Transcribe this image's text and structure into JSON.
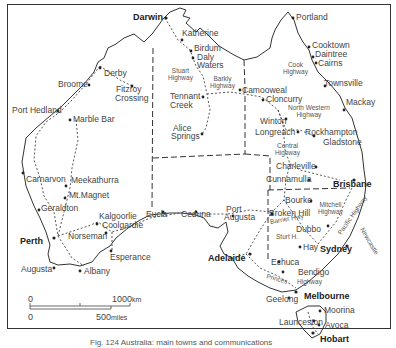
{
  "map": {
    "title": "Map of Australia — main towns and highways",
    "cities_bold": [
      {
        "name": "Darwin",
        "x": 133,
        "y": 13
      },
      {
        "name": "Brisbane",
        "x": 333,
        "y": 180
      },
      {
        "name": "Sydney",
        "x": 320,
        "y": 245
      },
      {
        "name": "Melbourne",
        "x": 304,
        "y": 292
      },
      {
        "name": "Adelaide",
        "x": 208,
        "y": 254
      },
      {
        "name": "Perth",
        "x": 20,
        "y": 237
      },
      {
        "name": "Hobart",
        "x": 320,
        "y": 335
      }
    ],
    "towns": [
      {
        "name": "Katherine",
        "x": 179,
        "y": 31
      },
      {
        "name": "Birdum",
        "x": 193,
        "y": 46
      },
      {
        "name": "Daly",
        "x": 197,
        "y": 55
      },
      {
        "name": "Waters",
        "x": 193,
        "y": 63
      },
      {
        "name": "Tennant",
        "x": 168,
        "y": 94
      },
      {
        "name": "Creek",
        "x": 168,
        "y": 102
      },
      {
        "name": "Alice",
        "x": 172,
        "y": 124
      },
      {
        "name": "Springs",
        "x": 170,
        "y": 132
      },
      {
        "name": "Camooweal",
        "x": 241,
        "y": 86
      },
      {
        "name": "Portland",
        "x": 295,
        "y": 15
      },
      {
        "name": "Cooktown",
        "x": 312,
        "y": 41
      },
      {
        "name": "Daintree",
        "x": 316,
        "y": 51
      },
      {
        "name": "Cairns",
        "x": 319,
        "y": 60
      },
      {
        "name": "Townsville",
        "x": 325,
        "y": 81
      },
      {
        "name": "Mackay",
        "x": 345,
        "y": 100
      },
      {
        "name": "Cloncurry",
        "x": 265,
        "y": 96
      },
      {
        "name": "Winton",
        "x": 261,
        "y": 120
      },
      {
        "name": "Longreach",
        "x": 254,
        "y": 130
      },
      {
        "name": "Rockhampton",
        "x": 305,
        "y": 130
      },
      {
        "name": "Gladstone",
        "x": 321,
        "y": 139
      },
      {
        "name": "Charleville",
        "x": 276,
        "y": 163
      },
      {
        "name": "Cunnamulla",
        "x": 266,
        "y": 176
      },
      {
        "name": "Bourke",
        "x": 284,
        "y": 196
      },
      {
        "name": "Broken Hill",
        "x": 269,
        "y": 209
      },
      {
        "name": "Dubbo",
        "x": 296,
        "y": 226
      },
      {
        "name": "Hay",
        "x": 305,
        "y": 244
      },
      {
        "name": "Echuca",
        "x": 270,
        "y": 259
      },
      {
        "name": "Bendigo",
        "x": 297,
        "y": 270
      },
      {
        "name": "Geelong",
        "x": 266,
        "y": 296
      },
      {
        "name": "Moorina",
        "x": 324,
        "y": 307
      },
      {
        "name": "Launceston",
        "x": 278,
        "y": 319
      },
      {
        "name": "Avoca",
        "x": 324,
        "y": 322
      },
      {
        "name": "Derby",
        "x": 103,
        "y": 70
      },
      {
        "name": "Broome",
        "x": 58,
        "y": 80
      },
      {
        "name": "Fitzroy",
        "x": 116,
        "y": 86
      },
      {
        "name": "Crossing",
        "x": 115,
        "y": 95
      },
      {
        "name": "Port Hedland",
        "x": 12,
        "y": 107
      },
      {
        "name": "Marble Bar",
        "x": 73,
        "y": 116
      },
      {
        "name": "Carnarvon",
        "x": 26,
        "y": 176
      },
      {
        "name": "Meekathurra",
        "x": 71,
        "y": 176
      },
      {
        "name": "Mt.Magnet",
        "x": 69,
        "y": 192
      },
      {
        "name": "Geraldton",
        "x": 41,
        "y": 204
      },
      {
        "name": "Kalgoorlie",
        "x": 100,
        "y": 213
      },
      {
        "name": "Coolgardie",
        "x": 103,
        "y": 222
      },
      {
        "name": "Norseman",
        "x": 68,
        "y": 232
      },
      {
        "name": "Esperance",
        "x": 110,
        "y": 253
      },
      {
        "name": "Augusta",
        "x": 21,
        "y": 265
      },
      {
        "name": "Albany",
        "x": 82,
        "y": 267
      },
      {
        "name": "Eucla",
        "x": 146,
        "y": 210
      },
      {
        "name": "Ceduna",
        "x": 181,
        "y": 210
      },
      {
        "name": "Port",
        "x": 226,
        "y": 206
      },
      {
        "name": "Augusta",
        "x": 224,
        "y": 214
      }
    ],
    "highways": [
      {
        "name": "Stuart\nHighway",
        "line1": "Stuart",
        "line2": "Highway",
        "x": 168,
        "y": 68
      },
      {
        "name": "Barkly\nHighway",
        "line1": "Barkly",
        "line2": "Highway",
        "x": 210,
        "y": 76
      },
      {
        "name": "Cook\nHighway",
        "line1": "Cook",
        "line2": "Highway",
        "x": 283,
        "y": 62
      },
      {
        "name": "North Western\nHighway",
        "line1": "North Western",
        "line2": "Highway",
        "x": 288,
        "y": 105
      },
      {
        "name": "Central\nHighway",
        "line1": "Central",
        "line2": "Highway",
        "x": 275,
        "y": 143
      },
      {
        "name": "Mitchell\nHighway",
        "line1": "Mitchell",
        "line2": "Highway",
        "x": 318,
        "y": 202
      },
      {
        "name": "Barrier Hwy",
        "line1": "Barrier Hwy",
        "line2": "",
        "x": 270,
        "y": 218
      },
      {
        "name": "Sturt H.",
        "line1": "Sturt H.",
        "line2": "",
        "x": 276,
        "y": 235
      },
      {
        "name": "Princes",
        "line1": "Princes",
        "line2": "",
        "x": 268,
        "y": 276
      },
      {
        "name": "Highway",
        "line1": "Highway",
        "line2": "",
        "x": 299,
        "y": 279
      },
      {
        "name": "Pacific Highway",
        "line1": "Pacific Highway",
        "line2": "",
        "x": 343,
        "y": 215
      },
      {
        "name": "Newcastle",
        "line1": "Newcastle",
        "line2": "",
        "x": 362,
        "y": 236
      }
    ],
    "scale": {
      "km_zero": "0",
      "km_value": "1000",
      "km_unit": "km",
      "mi_zero": "0",
      "mi_value": "500",
      "mi_unit": "miles"
    },
    "caption": "Fig. 124   Australia: main towns and communications"
  }
}
